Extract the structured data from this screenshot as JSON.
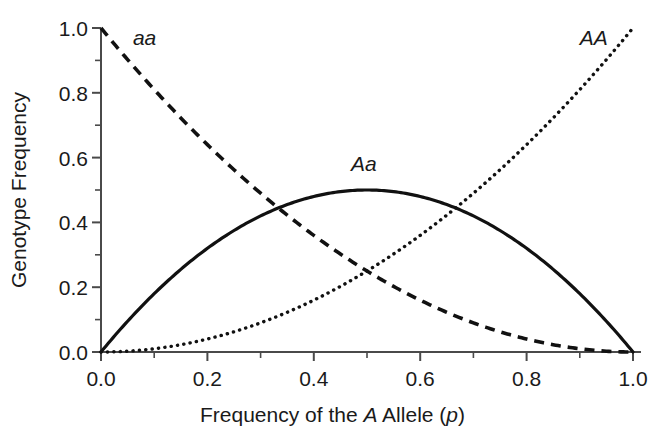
{
  "chart_data": {
    "type": "line",
    "title": "",
    "xlabel": "Frequency of the A Allele (p)",
    "ylabel": "Genotype Frequency",
    "xlim": [
      0.0,
      1.0
    ],
    "ylim": [
      0.0,
      1.0
    ],
    "grid": false,
    "legend_position": "inline-annotations",
    "x_ticks": [
      "0.0",
      "0.2",
      "0.4",
      "0.6",
      "0.8",
      "1.0"
    ],
    "x_tick_values": [
      0.0,
      0.2,
      0.4,
      0.6,
      0.8,
      1.0
    ],
    "x_minor_tick_values": [
      0.1,
      0.3,
      0.5,
      0.7,
      0.9
    ],
    "y_ticks": [
      "0.0",
      "0.2",
      "0.4",
      "0.6",
      "0.8",
      "1.0"
    ],
    "y_tick_values": [
      0.0,
      0.2,
      0.4,
      0.6,
      0.8,
      1.0
    ],
    "y_minor_tick_values": [
      0.1,
      0.3,
      0.5,
      0.7,
      0.9
    ],
    "x": [
      0.0,
      0.05,
      0.1,
      0.15,
      0.2,
      0.25,
      0.3,
      0.35,
      0.4,
      0.45,
      0.5,
      0.55,
      0.6,
      0.65,
      0.7,
      0.75,
      0.8,
      0.85,
      0.9,
      0.95,
      1.0
    ],
    "series": [
      {
        "name": "aa",
        "label": "aa",
        "formula": "(1-p)^2",
        "style": "dashed",
        "color": "#111111",
        "values": [
          1.0,
          0.9025,
          0.81,
          0.7225,
          0.64,
          0.5625,
          0.49,
          0.4225,
          0.36,
          0.3025,
          0.25,
          0.2025,
          0.16,
          0.1225,
          0.09,
          0.0625,
          0.04,
          0.0225,
          0.01,
          0.0025,
          0.0
        ]
      },
      {
        "name": "Aa",
        "label": "Aa",
        "formula": "2p(1-p)",
        "style": "solid",
        "color": "#111111",
        "values": [
          0.0,
          0.095,
          0.18,
          0.255,
          0.32,
          0.375,
          0.42,
          0.455,
          0.48,
          0.495,
          0.5,
          0.495,
          0.48,
          0.455,
          0.42,
          0.375,
          0.32,
          0.255,
          0.18,
          0.095,
          0.0
        ]
      },
      {
        "name": "AA",
        "label": "AA",
        "formula": "p^2",
        "style": "dotted",
        "color": "#111111",
        "values": [
          0.0,
          0.0025,
          0.01,
          0.0225,
          0.04,
          0.0625,
          0.09,
          0.1225,
          0.16,
          0.2025,
          0.25,
          0.3025,
          0.36,
          0.4225,
          0.49,
          0.5625,
          0.64,
          0.7225,
          0.81,
          0.9025,
          1.0
        ]
      }
    ],
    "annotations": [
      {
        "text": "aa",
        "x": 0.09,
        "y": 0.97,
        "italic": true
      },
      {
        "text": "Aa",
        "x": 0.5,
        "y": 0.58,
        "italic": true
      },
      {
        "text": "AA",
        "x": 0.93,
        "y": 0.97,
        "italic": true
      }
    ]
  },
  "axis": {
    "y_title": "Genotype Frequency",
    "x_title_parts": {
      "pre": "Frequency of the ",
      "allele": "A",
      "mid": " Allele (",
      "param": "p",
      "post": ")"
    },
    "x_title_full": "Frequency of the A Allele (p)",
    "y_tick_labels": [
      "1.0",
      "0.8",
      "0.6",
      "0.4",
      "0.2",
      "0.0"
    ],
    "x_tick_labels": [
      "0.0",
      "0.2",
      "0.4",
      "0.6",
      "0.8",
      "1.0"
    ]
  },
  "labels": {
    "aa": "aa",
    "Aa": "Aa",
    "AA": "AA"
  },
  "colors": {
    "ink": "#1a1a1a",
    "curve": "#111111",
    "axis": "#4a4a4a",
    "background": "#ffffff"
  }
}
